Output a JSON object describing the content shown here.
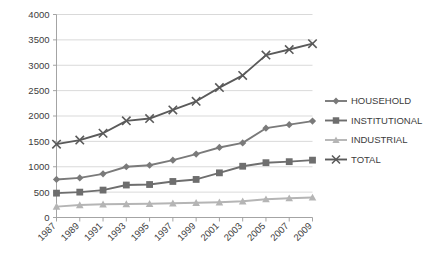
{
  "chart_data": {
    "type": "line",
    "title": "",
    "xlabel": "",
    "ylabel": "",
    "x": [
      1987,
      1989,
      1991,
      1993,
      1995,
      1997,
      1999,
      2001,
      2003,
      2005,
      2007,
      2009
    ],
    "categories": [
      "1987",
      "1989",
      "1991",
      "1993",
      "1995",
      "1997",
      "1999",
      "2001",
      "2003",
      "2005",
      "2007",
      "2009"
    ],
    "ylim": [
      0,
      4000
    ],
    "xlim": [
      1987,
      2009
    ],
    "yticks": [
      0,
      500,
      1000,
      1500,
      2000,
      2500,
      3000,
      3500,
      4000
    ],
    "ytick_labels": [
      "0",
      "500",
      "1000",
      "1500",
      "2000",
      "2500",
      "3000",
      "3500",
      "4000"
    ],
    "grid": true,
    "legend_position": "right",
    "series": [
      {
        "name": "HOUSEHOLD",
        "marker": "diamond",
        "color": "#7a7a7a",
        "values": [
          750,
          780,
          860,
          1000,
          1030,
          1130,
          1250,
          1380,
          1470,
          1760,
          1830,
          1900
        ]
      },
      {
        "name": "INSTITUTIONAL",
        "marker": "square",
        "color": "#6e6e6e",
        "values": [
          480,
          500,
          540,
          640,
          650,
          710,
          750,
          880,
          1010,
          1080,
          1100,
          1130
        ]
      },
      {
        "name": "INDUSTRIAL",
        "marker": "triangle",
        "color": "#b5b5b5",
        "values": [
          215,
          245,
          260,
          265,
          270,
          280,
          290,
          300,
          320,
          360,
          380,
          395
        ]
      },
      {
        "name": "TOTAL",
        "marker": "cross",
        "color": "#5a5a5a",
        "values": [
          1445,
          1525,
          1660,
          1905,
          1950,
          2120,
          2290,
          2560,
          2800,
          3200,
          3310,
          3425
        ]
      }
    ]
  },
  "axis": {
    "ytick_labels": [
      "4000",
      "3500",
      "3000",
      "2500",
      "2000",
      "1500",
      "1000",
      "500",
      "0"
    ],
    "xtick_labels": [
      "1987",
      "1989",
      "1991",
      "1993",
      "1995",
      "1997",
      "1999",
      "2001",
      "2003",
      "2005",
      "2007",
      "2009"
    ]
  },
  "legend": {
    "items": [
      {
        "label": "HOUSEHOLD",
        "color": "#7a7a7a",
        "marker": "diamond"
      },
      {
        "label": "INSTITUTIONAL",
        "color": "#6e6e6e",
        "marker": "square"
      },
      {
        "label": "INDUSTRIAL",
        "color": "#b5b5b5",
        "marker": "triangle"
      },
      {
        "label": "TOTAL",
        "color": "#5a5a5a",
        "marker": "cross"
      }
    ]
  },
  "colors": {
    "background": "#ffffff",
    "grid": "#c8c8c8",
    "axis": "#9a9a9a",
    "text": "#3c3c3c"
  }
}
